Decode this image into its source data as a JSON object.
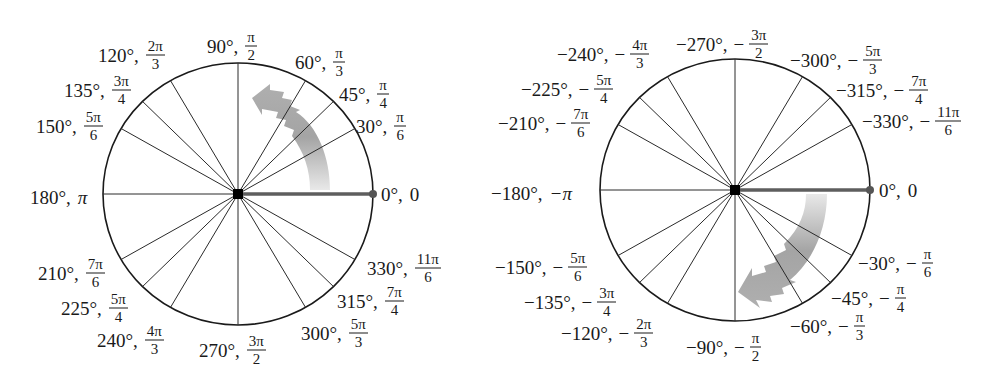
{
  "diagrams": [
    {
      "name": "positive-angles-circle",
      "center": [
        238,
        194
      ],
      "radius": [
        135,
        131
      ],
      "rotation_direction": "counterclockwise",
      "spoke_angles_deg": [
        0,
        30,
        45,
        60,
        90,
        120,
        135,
        150,
        180,
        210,
        225,
        240,
        270,
        300,
        315,
        330
      ],
      "labels": [
        {
          "deg": "0°,",
          "rad": "0",
          "type": "plain"
        },
        {
          "deg": "30°,",
          "num": "π",
          "den": "6"
        },
        {
          "deg": "45°,",
          "num": "π",
          "den": "4"
        },
        {
          "deg": "60°,",
          "num": "π",
          "den": "3"
        },
        {
          "deg": "90°,",
          "num": "π",
          "den": "2"
        },
        {
          "deg": "120°,",
          "num": "2π",
          "den": "3"
        },
        {
          "deg": "135°,",
          "num": "3π",
          "den": "4"
        },
        {
          "deg": "150°,",
          "num": "5π",
          "den": "6"
        },
        {
          "deg": "180°,",
          "rad": "π",
          "type": "plain"
        },
        {
          "deg": "210°,",
          "num": "7π",
          "den": "6"
        },
        {
          "deg": "225°,",
          "num": "5π",
          "den": "4"
        },
        {
          "deg": "240°,",
          "num": "4π",
          "den": "3"
        },
        {
          "deg": "270°,",
          "num": "3π",
          "den": "2"
        },
        {
          "deg": "300°,",
          "num": "5π",
          "den": "3"
        },
        {
          "deg": "315°,",
          "num": "7π",
          "den": "4"
        },
        {
          "deg": "330°,",
          "num": "11π",
          "den": "6"
        }
      ]
    },
    {
      "name": "negative-angles-circle",
      "center": [
        735,
        190
      ],
      "radius": [
        135,
        131
      ],
      "rotation_direction": "clockwise",
      "spoke_angles_deg": [
        0,
        -30,
        -45,
        -60,
        -90,
        -120,
        -135,
        -150,
        -180,
        -210,
        -225,
        -240,
        -270,
        -300,
        -315,
        -330
      ],
      "labels": [
        {
          "deg": "0°,",
          "rad": "0",
          "type": "plain"
        },
        {
          "deg": "−30°,",
          "sign": "−",
          "num": "π",
          "den": "6"
        },
        {
          "deg": "−45°,",
          "sign": "−",
          "num": "π",
          "den": "4"
        },
        {
          "deg": "−60°,",
          "sign": "−",
          "num": "π",
          "den": "3"
        },
        {
          "deg": "−90°,",
          "sign": "−",
          "num": "π",
          "den": "2"
        },
        {
          "deg": "−120°,",
          "sign": "−",
          "num": "2π",
          "den": "3"
        },
        {
          "deg": "−135°,",
          "sign": "−",
          "num": "3π",
          "den": "4"
        },
        {
          "deg": "−150°,",
          "sign": "−",
          "num": "5π",
          "den": "6"
        },
        {
          "deg": "−180°,",
          "rad": "−π",
          "type": "plain"
        },
        {
          "deg": "−210°,",
          "sign": "−",
          "num": "7π",
          "den": "6"
        },
        {
          "deg": "−225°,",
          "sign": "−",
          "num": "5π",
          "den": "4"
        },
        {
          "deg": "−240°,",
          "sign": "−",
          "num": "4π",
          "den": "3"
        },
        {
          "deg": "−270°,",
          "sign": "−",
          "num": "3π",
          "den": "2"
        },
        {
          "deg": "−300°,",
          "sign": "−",
          "num": "5π",
          "den": "3"
        },
        {
          "deg": "−315°,",
          "sign": "−",
          "num": "7π",
          "den": "4"
        },
        {
          "deg": "−330°,",
          "sign": "−",
          "num": "11π",
          "den": "6"
        }
      ]
    }
  ],
  "colors": {
    "circle": "#1a1a1a",
    "spoke": "#2a2a2a",
    "initial_side": "#6a6a6a",
    "arrow": "#a8a8a8",
    "center_dot": "#000000"
  }
}
